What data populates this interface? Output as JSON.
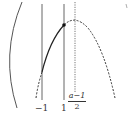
{
  "diagram": {
    "type": "parabola-interval-sketch",
    "colors": {
      "stroke": "#333333",
      "background": "#ffffff"
    },
    "vertical_lines": [
      {
        "id": "x-minus-1",
        "label": "−1",
        "style": "solid"
      },
      {
        "id": "x-1",
        "label": "1",
        "style": "solid"
      },
      {
        "id": "x-axis-of-symmetry",
        "label_numerator": "a−1",
        "label_denominator": "2",
        "style": "dotted"
      }
    ],
    "curve": {
      "kind": "downward parabola",
      "solid_segment": "between x=−1 and x=1",
      "dashed_segments": "outside [−1, 1]"
    },
    "point": {
      "at": "x=1",
      "style": "filled"
    },
    "left_arc": "large left bracket arc"
  }
}
